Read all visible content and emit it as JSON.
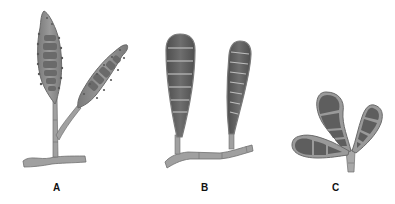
{
  "figure": {
    "panels": [
      {
        "id": "A",
        "label": "A",
        "description": "Two spindle-shaped echinulate conidia with transverse septa on a branched conidiophore"
      },
      {
        "id": "B",
        "label": "B",
        "description": "Two clavate dark septate conidia on a septate hypha"
      },
      {
        "id": "C",
        "label": "C",
        "description": "Three obovoid/clavate conidia with transverse and oblique septa on a short stalk"
      }
    ]
  },
  "colors": {
    "background": "#ffffff",
    "cell_fill": "#8a8a8a",
    "cell_dark": "#5e5e5e",
    "wall": "#a8a8a8",
    "outline": "#6a6a6a",
    "septum": "#c8c8c8",
    "label": "#111111"
  }
}
